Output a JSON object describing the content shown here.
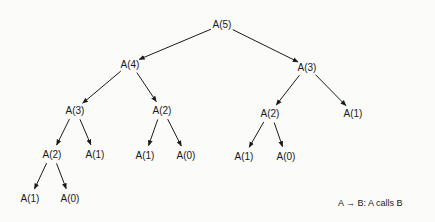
{
  "nodes": [
    {
      "id": "n0",
      "label": "A(5)",
      "x": 222,
      "y": 24
    },
    {
      "id": "n1",
      "label": "A(4)",
      "x": 130,
      "y": 64
    },
    {
      "id": "n2",
      "label": "A(3)",
      "x": 307,
      "y": 67
    },
    {
      "id": "n3",
      "label": "A(3)",
      "x": 75,
      "y": 110
    },
    {
      "id": "n4",
      "label": "A(2)",
      "x": 162,
      "y": 110
    },
    {
      "id": "n5",
      "label": "A(2)",
      "x": 270,
      "y": 113
    },
    {
      "id": "n6",
      "label": "A(1)",
      "x": 353,
      "y": 113
    },
    {
      "id": "n7",
      "label": "A(2)",
      "x": 52,
      "y": 154
    },
    {
      "id": "n8",
      "label": "A(1)",
      "x": 95,
      "y": 154
    },
    {
      "id": "n9",
      "label": "A(1)",
      "x": 145,
      "y": 155
    },
    {
      "id": "n10",
      "label": "A(0)",
      "x": 186,
      "y": 155
    },
    {
      "id": "n11",
      "label": "A(1)",
      "x": 244,
      "y": 156
    },
    {
      "id": "n12",
      "label": "A(0)",
      "x": 286,
      "y": 156
    },
    {
      "id": "n13",
      "label": "A(1)",
      "x": 30,
      "y": 198
    },
    {
      "id": "n14",
      "label": "A(0)",
      "x": 70,
      "y": 198
    }
  ],
  "edges": [
    [
      "n0",
      "n1"
    ],
    [
      "n0",
      "n2"
    ],
    [
      "n1",
      "n3"
    ],
    [
      "n1",
      "n4"
    ],
    [
      "n2",
      "n5"
    ],
    [
      "n2",
      "n6"
    ],
    [
      "n3",
      "n7"
    ],
    [
      "n3",
      "n8"
    ],
    [
      "n4",
      "n9"
    ],
    [
      "n4",
      "n10"
    ],
    [
      "n5",
      "n11"
    ],
    [
      "n5",
      "n12"
    ],
    [
      "n7",
      "n13"
    ],
    [
      "n7",
      "n14"
    ]
  ],
  "legend": {
    "text": "A → B: A calls B"
  }
}
